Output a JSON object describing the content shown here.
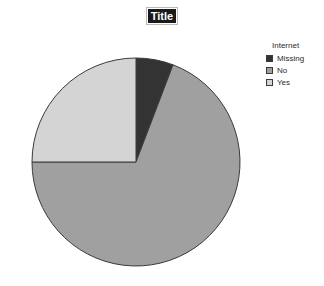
{
  "chart_data": {
    "type": "pie",
    "title": "Title",
    "legend_title": "Internet",
    "legend_position": "right",
    "categories": [
      "Missing",
      "No",
      "Yes"
    ],
    "values": [
      5.8,
      69.2,
      25.0
    ],
    "colors": [
      "#333333",
      "#a0a0a0",
      "#d4d4d4"
    ],
    "start_angle_deg": 0,
    "direction": "clockwise",
    "slice_angles_deg": [
      21,
      249,
      90
    ],
    "outline_color": "#3a3a3a",
    "grid": false,
    "xlabel": "",
    "ylabel": ""
  },
  "title": {
    "text": "Title",
    "selected": true
  },
  "legend": {
    "title": "Internet",
    "items": [
      {
        "label": "Missing",
        "color": "#333333"
      },
      {
        "label": "No",
        "color": "#a0a0a0"
      },
      {
        "label": "Yes",
        "color": "#d4d4d4"
      }
    ]
  }
}
